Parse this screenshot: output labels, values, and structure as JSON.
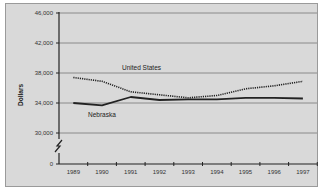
{
  "chart_data": {
    "type": "line",
    "title": "",
    "xlabel": "",
    "ylabel": "Dollars",
    "x": [
      "1989",
      "1990",
      "1991",
      "1992",
      "1993",
      "1994",
      "1995",
      "1996",
      "1997"
    ],
    "yticks": [
      "46,000",
      "42,000",
      "38,000",
      "34,000",
      "30,000",
      "0"
    ],
    "ylim": [
      30000,
      46000
    ],
    "axis_break": true,
    "grid": true,
    "legend": "inline labels",
    "series": [
      {
        "name": "United States",
        "style": "dotted",
        "values": [
          37400,
          36900,
          35500,
          35100,
          34700,
          35000,
          35900,
          36300,
          36900
        ]
      },
      {
        "name": "Nebraska",
        "style": "solid",
        "values": [
          34000,
          33700,
          34800,
          34400,
          34500,
          34500,
          34700,
          34700,
          34600
        ]
      }
    ]
  }
}
